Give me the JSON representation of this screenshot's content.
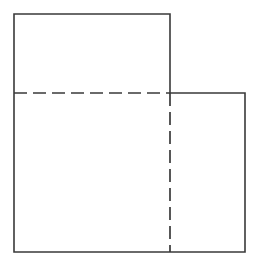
{
  "figure": {
    "type": "geometry-diagram",
    "canvas": {
      "width": 258,
      "height": 264,
      "background": "#ffffff"
    },
    "style": {
      "solid_stroke_color": "#3a3a3a",
      "solid_stroke_width": 1.6,
      "hidden_stroke_color": "#3a3a3a",
      "hidden_stroke_width": 1.7,
      "hidden_dash_pattern": "13 6",
      "fill_color": "#ffffff"
    },
    "outline": {
      "name": "outer-boundary",
      "closed": true,
      "points": [
        {
          "x": 14,
          "y": 14
        },
        {
          "x": 170,
          "y": 14
        },
        {
          "x": 170,
          "y": 93
        },
        {
          "x": 245,
          "y": 93
        },
        {
          "x": 245,
          "y": 252
        },
        {
          "x": 14,
          "y": 252
        }
      ],
      "path": "M 14 14 L 170 14 L 170 93 L 245 93 L 245 252 L 14 252 Z"
    },
    "hidden_lines": [
      {
        "name": "horizontal-hidden-line",
        "orientation": "horizontal",
        "x1": 14,
        "y1": 93,
        "x2": 170,
        "y2": 93,
        "length": 156,
        "dash": "13 6"
      },
      {
        "name": "vertical-hidden-line",
        "orientation": "vertical",
        "x1": 170,
        "y1": 93,
        "x2": 170,
        "y2": 252,
        "length": 159,
        "dash": "13 6"
      }
    ],
    "regions": [
      {
        "name": "upper-left-rectangle",
        "x": 14,
        "y": 14,
        "width": 156,
        "height": 79
      },
      {
        "name": "lower-left-rectangle",
        "x": 14,
        "y": 93,
        "width": 156,
        "height": 159
      },
      {
        "name": "lower-right-rectangle",
        "x": 170,
        "y": 93,
        "width": 75,
        "height": 159
      }
    ],
    "labels": []
  }
}
